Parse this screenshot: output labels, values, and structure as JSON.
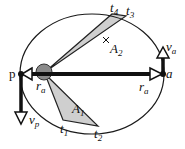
{
  "diagram": {
    "type": "orbit-kepler-second-law",
    "colors": {
      "ellipse": "#1a1a1a",
      "sector_fill": "#cfcfcf",
      "sun_fill": "#8a8a8a",
      "arrow": "#111111",
      "background": "#ffffff"
    },
    "labels": {
      "perihelion": "p",
      "aphelion": "a",
      "r_perihelion": "r",
      "r_perihelion_sub": "a",
      "r_aphelion": "r",
      "r_aphelion_sub": "a",
      "v_perihelion": "v",
      "v_perihelion_sub": "p",
      "v_aphelion": "v",
      "v_aphelion_sub": "a",
      "area1": "A",
      "area1_sub": "1",
      "area2": "A",
      "area2_sub": "2",
      "t1": "t",
      "t1_sub": "1",
      "t2": "t",
      "t2_sub": "2",
      "t3": "t",
      "t3_sub": "3",
      "t4": "t",
      "t4_sub": "4"
    }
  }
}
